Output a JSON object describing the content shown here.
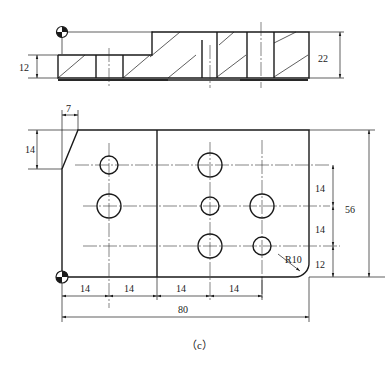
{
  "figure": {
    "caption": "（c）",
    "top_view": {
      "dims": {
        "lower_height": "12",
        "total_height": "22"
      }
    },
    "plan_view": {
      "dims": {
        "chamfer_width": "7",
        "chamfer_height": "14",
        "row_spacing_1": "14",
        "row_spacing_2": "14",
        "bottom_offset": "12",
        "total_height": "56",
        "col_spacing_1": "14",
        "col_spacing_2": "14",
        "col_spacing_3": "14",
        "col_spacing_4": "14",
        "total_width": "80",
        "corner_radius": "R10"
      }
    }
  }
}
